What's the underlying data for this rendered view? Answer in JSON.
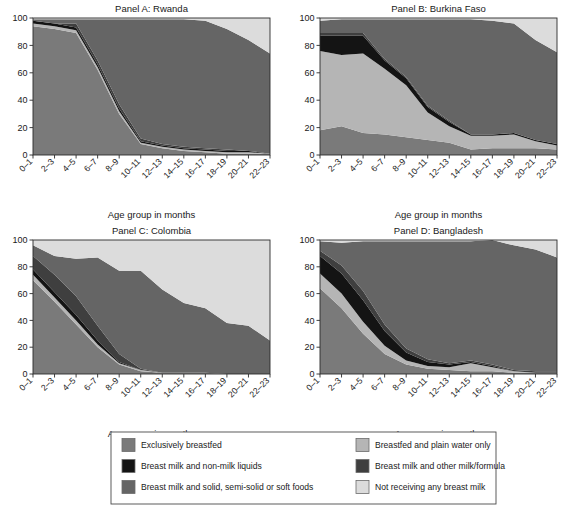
{
  "chart_data": {
    "type": "area",
    "layout": "2x2 panel grid of stacked area charts, shared legend below",
    "grid": false,
    "legend_position": "bottom",
    "xlabel": "Age group in months",
    "ylabel": "",
    "ylim": [
      0,
      100
    ],
    "yticks": [
      0,
      20,
      40,
      60,
      80,
      100
    ],
    "categories": [
      "0–1",
      "2–3",
      "4–5",
      "6–7",
      "8–9",
      "10–11",
      "12–13",
      "14–15",
      "16–17",
      "18–19",
      "20–21",
      "22–23"
    ],
    "series_names": [
      "Exclusively breastfed",
      "Breastfed and plain water only",
      "Breast milk and non-milk liquids",
      "Breast milk and other milk/formula",
      "Breast milk and solid, semi-solid or soft foods",
      "Not receiving any breast milk"
    ],
    "series_colors": [
      "#7a7a7a",
      "#b5b5b5",
      "#141414",
      "#3f3f3f",
      "#656565",
      "#dcdcdc"
    ],
    "panels": [
      {
        "id": "panel-a",
        "title": "Panel A: Rwanda",
        "series": [
          {
            "name": "Exclusively breastfed",
            "values": [
              94,
              92,
              89,
              62,
              30,
              8,
              5,
              3,
              2,
              1,
              1,
              1
            ]
          },
          {
            "name": "Breastfed and plain water only",
            "values": [
              2,
              2,
              2,
              2,
              2,
              1,
              1,
              1,
              1,
              1,
              1,
              0
            ]
          },
          {
            "name": "Breast milk and non-milk liquids",
            "values": [
              2,
              2,
              2,
              2,
              2,
              1,
              1,
              1,
              1,
              1,
              1,
              0
            ]
          },
          {
            "name": "Breast milk and other milk/formula",
            "values": [
              0,
              0,
              3,
              3,
              3,
              2,
              1,
              1,
              1,
              1,
              0,
              0
            ]
          },
          {
            "name": "Breast milk and solid, semi-solid or soft foods",
            "values": [
              1,
              3,
              3,
              30,
              62,
              87,
              91,
              93,
              93,
              88,
              81,
              73
            ]
          },
          {
            "name": "Not receiving any breast milk",
            "values": [
              1,
              1,
              1,
              1,
              1,
              1,
              1,
              1,
              2,
              8,
              16,
              26
            ]
          }
        ]
      },
      {
        "id": "panel-b",
        "title": "Panel B: Burkina Faso",
        "series": [
          {
            "name": "Exclusively breastfed",
            "values": [
              18,
              21,
              16,
              15,
              13,
              11,
              9,
              4,
              5,
              5,
              5,
              4
            ]
          },
          {
            "name": "Breastfed and plain water only",
            "values": [
              58,
              52,
              58,
              48,
              38,
              20,
              12,
              10,
              9,
              10,
              5,
              3
            ]
          },
          {
            "name": "Breast milk and non-milk liquids",
            "values": [
              11,
              14,
              13,
              6,
              5,
              4,
              3,
              1,
              1,
              1,
              1,
              1
            ]
          },
          {
            "name": "Breast milk and other milk/formula",
            "values": [
              2,
              2,
              2,
              1,
              1,
              1,
              1,
              0,
              0,
              0,
              0,
              0
            ]
          },
          {
            "name": "Breast milk and solid, semi-solid or soft foods",
            "values": [
              9,
              10,
              10,
              29,
              42,
              63,
              74,
              84,
              83,
              80,
              73,
              67
            ]
          },
          {
            "name": "Not receiving any breast milk",
            "values": [
              2,
              1,
              1,
              1,
              1,
              1,
              1,
              1,
              2,
              4,
              16,
              25
            ]
          }
        ]
      },
      {
        "id": "panel-c",
        "title": "Panel C: Colombia",
        "series": [
          {
            "name": "Exclusively breastfed",
            "values": [
              70,
              54,
              37,
              20,
              7,
              2,
              1,
              1,
              1,
              0,
              0,
              0
            ]
          },
          {
            "name": "Breastfed and plain water only",
            "values": [
              4,
              3,
              3,
              2,
              1,
              1,
              0,
              0,
              0,
              0,
              0,
              0
            ]
          },
          {
            "name": "Breast milk and non-milk liquids",
            "values": [
              4,
              4,
              4,
              3,
              1,
              0,
              0,
              0,
              0,
              0,
              0,
              0
            ]
          },
          {
            "name": "Breast milk and other milk/formula",
            "values": [
              10,
              13,
              14,
              11,
              6,
              1,
              0,
              0,
              0,
              0,
              0,
              0
            ]
          },
          {
            "name": "Breast milk and solid, semi-solid or soft foods",
            "values": [
              8,
              14,
              28,
              51,
              62,
              73,
              62,
              52,
              48,
              38,
              36,
              25
            ]
          },
          {
            "name": "Not receiving any breast milk",
            "values": [
              4,
              12,
              14,
              13,
              23,
              23,
              37,
              47,
              51,
              62,
              64,
              75
            ]
          }
        ]
      },
      {
        "id": "panel-d",
        "title": "Panel D: Bangladesh",
        "series": [
          {
            "name": "Exclusively breastfed",
            "values": [
              64,
              49,
              30,
              15,
              7,
              4,
              3,
              2,
              2,
              1,
              1,
              1
            ]
          },
          {
            "name": "Breastfed and plain water only",
            "values": [
              11,
              11,
              9,
              6,
              3,
              2,
              2,
              6,
              3,
              1,
              0,
              0
            ]
          },
          {
            "name": "Breast milk and non-milk liquids",
            "values": [
              13,
              15,
              16,
              11,
              6,
              3,
              2,
              1,
              1,
              0,
              0,
              0
            ]
          },
          {
            "name": "Breast milk and other milk/formula",
            "values": [
              4,
              6,
              7,
              5,
              3,
              2,
              1,
              1,
              1,
              1,
              1,
              1
            ]
          },
          {
            "name": "Breast milk and solid, semi-solid or soft foods",
            "values": [
              7,
              17,
              37,
              62,
              80,
              88,
              91,
              89,
              93,
              93,
              91,
              85
            ]
          },
          {
            "name": "Not receiving any breast milk",
            "values": [
              1,
              2,
              1,
              1,
              1,
              1,
              1,
              1,
              0,
              4,
              7,
              13
            ]
          }
        ]
      }
    ],
    "legend": {
      "column_left": [
        "Exclusively breastfed",
        "Breast milk and non-milk liquids",
        "Breast milk and solid, semi-solid or soft foods"
      ],
      "column_left_colors": [
        "#7a7a7a",
        "#141414",
        "#656565"
      ],
      "column_right": [
        "Breastfed and plain water only",
        "Breast milk and other milk/formula",
        "Not receiving any breast milk"
      ],
      "column_right_colors": [
        "#b5b5b5",
        "#3f3f3f",
        "#dcdcdc"
      ]
    }
  }
}
